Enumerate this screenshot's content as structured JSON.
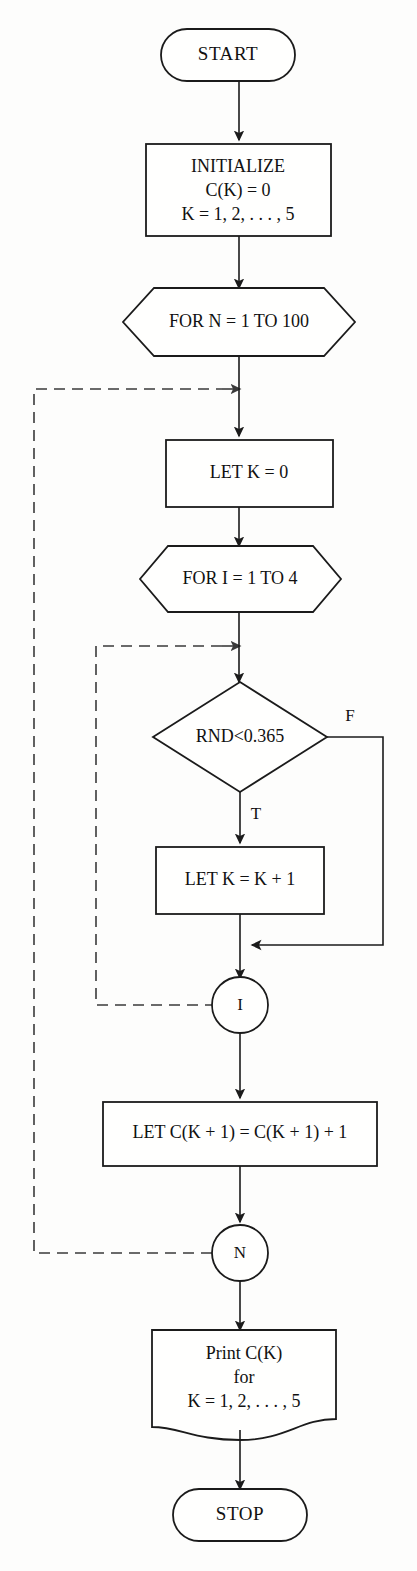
{
  "diagram": {
    "background_color": "#fdfdfc",
    "stroke_color": "#1b1b1b",
    "dashed_color": "#3a3a3a"
  },
  "nodes": {
    "start": {
      "label": "START",
      "shape": "terminator"
    },
    "initialize": {
      "line1": "INITIALIZE",
      "line2": "C(K) = 0",
      "line3": "K = 1, 2, . . . , 5",
      "shape": "process"
    },
    "for_n": {
      "label": "FOR N = 1 TO 100",
      "shape": "hexagon"
    },
    "let_k0": {
      "label": "LET K = 0",
      "shape": "process"
    },
    "for_i": {
      "label": "FOR I = 1 TO 4",
      "shape": "hexagon"
    },
    "decision": {
      "label": "RND<0.365",
      "shape": "decision"
    },
    "let_k_inc": {
      "label": "LET K = K + 1",
      "shape": "process"
    },
    "conn_i": {
      "label": "I",
      "shape": "connector"
    },
    "let_c": {
      "label": "LET C(K + 1) = C(K + 1) + 1",
      "shape": "process"
    },
    "conn_n": {
      "label": "N",
      "shape": "connector"
    },
    "print": {
      "line1": "Print C(K)",
      "line2": "for",
      "line3": "K = 1, 2, . . . , 5",
      "shape": "document"
    },
    "stop": {
      "label": "STOP",
      "shape": "terminator"
    }
  },
  "edge_labels": {
    "decision_false": "F",
    "decision_true": "T"
  }
}
